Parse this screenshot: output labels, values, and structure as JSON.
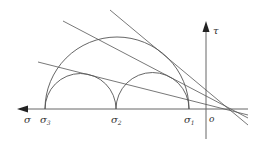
{
  "diagram": {
    "type": "Mohr circle diagram",
    "axes": {
      "horizontal_label": "σ",
      "vertical_label": "τ",
      "origin_label": "o"
    },
    "points": [
      {
        "label": "σ",
        "sub": "3"
      },
      {
        "label": "σ",
        "sub": "2"
      },
      {
        "label": "σ",
        "sub": "1"
      }
    ],
    "circles": [
      {
        "name": "large circle σ3–σ1"
      },
      {
        "name": "small circle σ3–σ2"
      },
      {
        "name": "small circle σ2–σ1"
      }
    ],
    "tangent_lines": 3,
    "stroke_color": "#555555"
  }
}
